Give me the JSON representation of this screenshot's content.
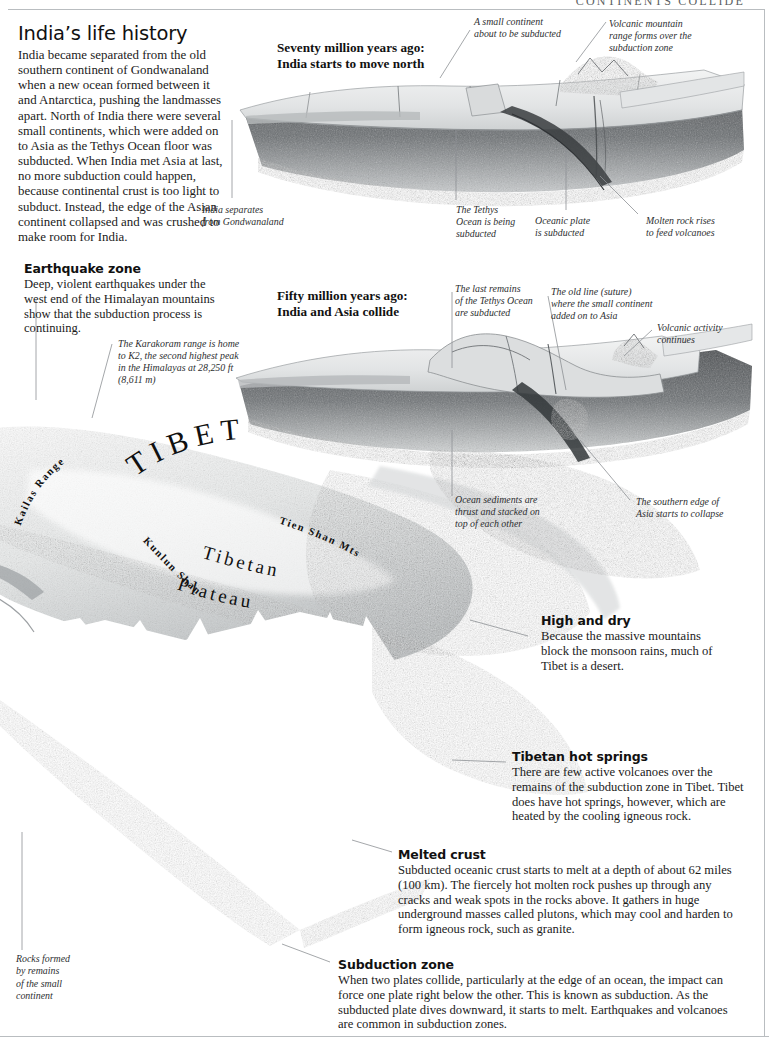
{
  "running_head": "CONTINENTS COLLIDE",
  "intro": {
    "title": "India’s life history",
    "body": "India became separated from the old southern continent of Gondwanaland when a new ocean formed between it and Antarctica, pushing the landmasses apart. North of India there were several small continents, which were added on to Asia as the Tethys Ocean floor was subducted. When India met Asia at last, no more subduction could happen, because continental crust is too light to subduct. Instead, the edge of the Asian continent collapsed and was crushed to make room for India."
  },
  "stage_one": {
    "heading_line1": "Seventy million years ago:",
    "heading_line2": "India starts to move north",
    "labels": {
      "small_continent": "A small continent\nabout to be subducted",
      "volcanic_range": "Volcanic mountain\nrange forms over the\nsubduction zone",
      "india_separates": "India separates\nfrom Gondwanaland",
      "tethys": "The Tethys\nOcean is being\nsubducted",
      "oceanic_plate": "Oceanic plate\nis subducted",
      "molten_rock": "Molten rock rises\nto feed volcanoes"
    }
  },
  "stage_two": {
    "heading_line1": "Fifty million years ago:",
    "heading_line2": "India and Asia collide",
    "labels": {
      "last_remains": "The last remains\nof the Tethys Ocean\nare subducted",
      "old_suture": "The old line (suture)\nwhere the small continent\nadded on to Asia",
      "volcanic_activity": "Volcanic activity\ncontinues",
      "ocean_sediments": "Ocean sediments are\nthrust and stacked on\ntop of each other",
      "southern_edge": "The southern edge of\nAsia starts to collapse"
    }
  },
  "earthquake_zone": {
    "title": "Earthquake zone",
    "body": "Deep, violent earthquakes under the west end of the Himalayan mountains show that the subduction process is continuing."
  },
  "karakoram_note": "The Karakoram range is home to K2, the second highest peak in the Himalayas at 28,250 ft (8,611 m)",
  "map_labels": {
    "tibet": "TIBET",
    "kailas_range": "Kailas Range",
    "tien_shan": "Tien Shan Mts",
    "kunlun_shan": "Kunlun Shan",
    "tibetan": "Tibetan",
    "plateau": "Plateau"
  },
  "high_and_dry": {
    "title": "High and dry",
    "body": "Because the massive mountains block the monsoon rains, much of Tibet is a desert."
  },
  "hot_springs": {
    "title": "Tibetan hot springs",
    "body": "There are few active volcanoes over the remains of the subduction zone in Tibet. Tibet does have hot springs, however, which are heated by the cooling igneous rock."
  },
  "melted_crust": {
    "title": "Melted crust",
    "body": "Subducted oceanic crust starts to melt at a depth of about 62 miles (100 km). The fiercely hot molten rock pushes up through any cracks and weak spots in the rocks above. It gathers in huge underground masses called plutons, which may cool and harden to form igneous rock, such as granite."
  },
  "subduction_zone": {
    "title": "Subduction zone",
    "body": "When two plates collide, particularly at the edge of an ocean, the impact can force one plate right below the other. This is known as subduction. As the subducted plate dives downward, it starts to melt. Earthquakes and volcanoes are common in subduction zones."
  },
  "rocks_formed_caption": "Rocks formed\nby remains\nof the small\ncontinent",
  "colors": {
    "rule": "#b9bdc0",
    "leader": "#8d9194",
    "text": "#1b1b1b",
    "rock_dark": "#4a4d50",
    "rock_mid": "#8e9295",
    "rock_light": "#d6d8d9"
  }
}
